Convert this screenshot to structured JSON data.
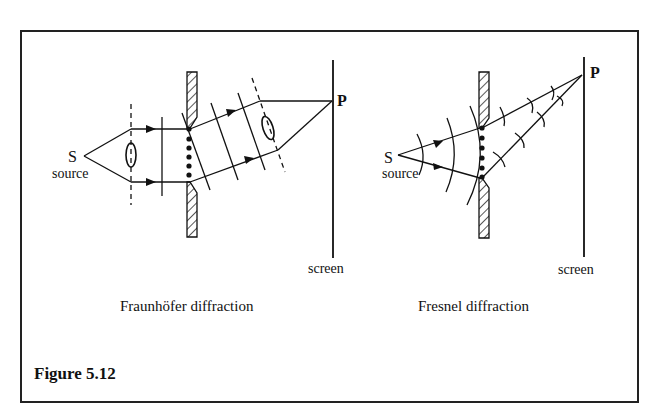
{
  "figure": {
    "label": "Figure 5.12",
    "border_color": "#222222"
  },
  "fraunhofer": {
    "caption": "Fraunhöfer diffraction",
    "source_letter": "S",
    "source_label": "source",
    "point_label": "P",
    "screen_label": "screen"
  },
  "fresnel": {
    "caption": "Fresnel diffraction",
    "source_letter": "S",
    "source_label": "source",
    "point_label": "P",
    "screen_label": "screen"
  }
}
